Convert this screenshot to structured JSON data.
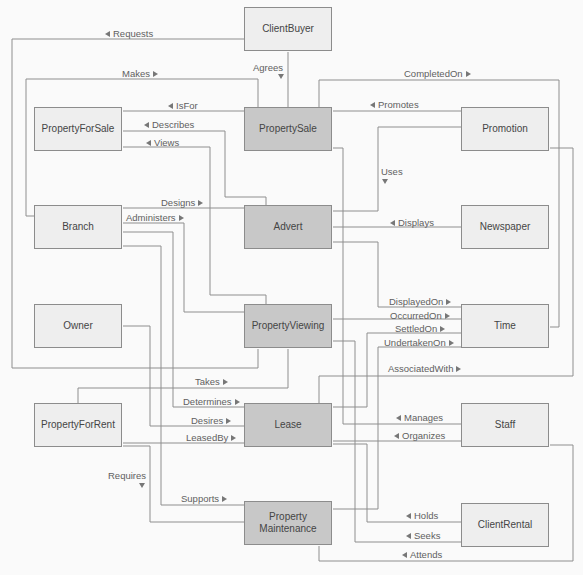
{
  "entities": [
    {
      "label": "ClientBuyer",
      "kind": "dimension"
    },
    {
      "label": "PropertyForSale",
      "kind": "dimension"
    },
    {
      "label": "PropertySale",
      "kind": "fact"
    },
    {
      "label": "Promotion",
      "kind": "dimension"
    },
    {
      "label": "Branch",
      "kind": "dimension"
    },
    {
      "label": "Advert",
      "kind": "fact"
    },
    {
      "label": "Newspaper",
      "kind": "dimension"
    },
    {
      "label": "Owner",
      "kind": "dimension"
    },
    {
      "label": "PropertyViewing",
      "kind": "fact"
    },
    {
      "label": "Time",
      "kind": "dimension"
    },
    {
      "label": "PropertyForRent",
      "kind": "dimension"
    },
    {
      "label": "Lease",
      "kind": "fact"
    },
    {
      "label": "Staff",
      "kind": "dimension"
    },
    {
      "label": "Property Maintenance",
      "kind": "fact"
    },
    {
      "label": "ClientRental",
      "kind": "dimension"
    }
  ],
  "relationships": [
    {
      "label": "Requests",
      "arrow": "left"
    },
    {
      "label": "Makes",
      "arrow": "right"
    },
    {
      "label": "Agrees",
      "arrow": "down"
    },
    {
      "label": "IsFor",
      "arrow": "left"
    },
    {
      "label": "Describes",
      "arrow": "left"
    },
    {
      "label": "Views",
      "arrow": "left"
    },
    {
      "label": "Designs",
      "arrow": "right"
    },
    {
      "label": "Administers",
      "arrow": "right"
    },
    {
      "label": "CompletedOn",
      "arrow": "right"
    },
    {
      "label": "Promotes",
      "arrow": "left"
    },
    {
      "label": "Uses",
      "arrow": "down"
    },
    {
      "label": "Displays",
      "arrow": "left"
    },
    {
      "label": "DisplayedOn",
      "arrow": "right"
    },
    {
      "label": "OccurredOn",
      "arrow": "right"
    },
    {
      "label": "SettledOn",
      "arrow": "right"
    },
    {
      "label": "UndertakenOn",
      "arrow": "right"
    },
    {
      "label": "AssociatedWith",
      "arrow": "right"
    },
    {
      "label": "Takes",
      "arrow": "right"
    },
    {
      "label": "Determines",
      "arrow": "right"
    },
    {
      "label": "Desires",
      "arrow": "right"
    },
    {
      "label": "LeasedBy",
      "arrow": "right"
    },
    {
      "label": "Requires",
      "arrow": "down"
    },
    {
      "label": "Supports",
      "arrow": "right"
    },
    {
      "label": "Manages",
      "arrow": "left"
    },
    {
      "label": "Organizes",
      "arrow": "left"
    },
    {
      "label": "Holds",
      "arrow": "left"
    },
    {
      "label": "Seeks",
      "arrow": "left"
    },
    {
      "label": "Attends",
      "arrow": "left"
    }
  ],
  "colors": {
    "background": "#fafafa",
    "dimension_fill": "#eeeeee",
    "fact_fill": "#c8c8c8",
    "border": "#8c8c8c",
    "connector": "#8e8e8e"
  }
}
